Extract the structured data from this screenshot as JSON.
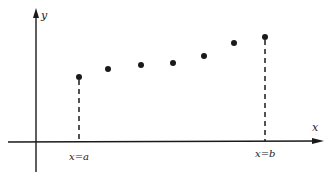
{
  "diagram": {
    "axes": {
      "x_label": "x",
      "y_label": "y"
    },
    "boundaries": [
      {
        "label": "x=a",
        "x": 79,
        "y_top": 77
      },
      {
        "label": "x=b",
        "x": 265,
        "y_top": 37
      }
    ],
    "points": [
      {
        "x": 79,
        "y": 77
      },
      {
        "x": 108,
        "y": 69
      },
      {
        "x": 141,
        "y": 65
      },
      {
        "x": 173,
        "y": 63
      },
      {
        "x": 204,
        "y": 56
      },
      {
        "x": 234,
        "y": 43
      },
      {
        "x": 265,
        "y": 37
      }
    ],
    "colors": {
      "ink": "#1a1a1a",
      "background": "#ffffff"
    }
  }
}
